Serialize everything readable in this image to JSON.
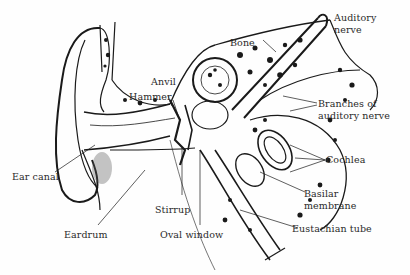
{
  "diagram": {
    "colors": {
      "ink": "#1a1a1a",
      "paper": "#fefefe",
      "label": "#2a2a2a"
    },
    "labels": {
      "auditory_nerve_1": "Auditory",
      "auditory_nerve_2": "nerve",
      "bone": "Bone",
      "anvil": "Anvil",
      "hammer": "Hammer",
      "branches_1": "Branches of",
      "branches_2": "auditory nerve",
      "cochlea": "Cochlea",
      "ear_canal": "Ear canal",
      "basilar_1": "Basilar",
      "basilar_2": "membrane",
      "stirrup": "Stirrup",
      "eardrum": "Eardrum",
      "oval_window": "Oval window",
      "eustachian_tube": "Eustachian tube"
    }
  }
}
